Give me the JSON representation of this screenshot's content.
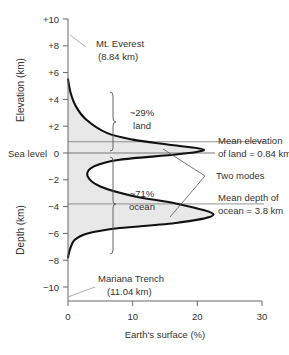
{
  "chart_data": {
    "type": "line",
    "title": "",
    "xlabel": "Earth's surface (%)",
    "ylabel_top": "Elevation (km)",
    "ylabel_bottom": "Depth (km)",
    "xlim": [
      0,
      30
    ],
    "ylim": [
      -11,
      10
    ],
    "x_ticks": [
      {
        "value": 0,
        "label": "0"
      },
      {
        "value": 10,
        "label": "10"
      },
      {
        "value": 20,
        "label": "20"
      },
      {
        "value": 30,
        "label": "30"
      }
    ],
    "y_ticks": [
      {
        "value": 10,
        "label": "+10"
      },
      {
        "value": 8,
        "label": "+8"
      },
      {
        "value": 6,
        "label": "+6"
      },
      {
        "value": 4,
        "label": "+4"
      },
      {
        "value": 2,
        "label": "+2"
      },
      {
        "value": 0,
        "label": "0"
      },
      {
        "value": -2,
        "label": "−2"
      },
      {
        "value": -4,
        "label": "−4"
      },
      {
        "value": -6,
        "label": "−6"
      },
      {
        "value": -8,
        "label": "−8"
      },
      {
        "value": -10,
        "label": "−10"
      }
    ],
    "sea_level_label": "Sea level",
    "series": [
      {
        "name": "Hypsometric distribution",
        "points": [
          {
            "elev": 5.5,
            "pct": 0.0
          },
          {
            "elev": 4.5,
            "pct": 0.4
          },
          {
            "elev": 3.5,
            "pct": 1.2
          },
          {
            "elev": 2.5,
            "pct": 2.8
          },
          {
            "elev": 1.5,
            "pct": 6.0
          },
          {
            "elev": 1.0,
            "pct": 10.0
          },
          {
            "elev": 0.6,
            "pct": 16.0
          },
          {
            "elev": 0.25,
            "pct": 21.0
          },
          {
            "elev": -0.1,
            "pct": 17.0
          },
          {
            "elev": -0.5,
            "pct": 8.0
          },
          {
            "elev": -1.0,
            "pct": 4.0
          },
          {
            "elev": -1.7,
            "pct": 3.0
          },
          {
            "elev": -2.5,
            "pct": 5.0
          },
          {
            "elev": -3.2,
            "pct": 10.0
          },
          {
            "elev": -3.8,
            "pct": 17.0
          },
          {
            "elev": -4.6,
            "pct": 22.5
          },
          {
            "elev": -5.2,
            "pct": 17.0
          },
          {
            "elev": -5.6,
            "pct": 8.0
          },
          {
            "elev": -6.0,
            "pct": 3.0
          },
          {
            "elev": -6.5,
            "pct": 1.0
          },
          {
            "elev": -7.2,
            "pct": 0.3
          },
          {
            "elev": -7.8,
            "pct": 0.0
          }
        ]
      }
    ],
    "reference_lines": [
      {
        "elev": 0,
        "label": "Sea level"
      },
      {
        "elev": 0.84,
        "label": "Mean elevation of land = 0.84 km"
      },
      {
        "elev": -3.8,
        "label": "Mean depth of ocean = 3.8 km"
      }
    ],
    "annotations": [
      {
        "text_lines": [
          "Mt. Everest",
          "(8.84 km)"
        ],
        "elev": 8.84,
        "pct": 0
      },
      {
        "text_lines": [
          "Mariana Trench",
          "(11.04 km)"
        ],
        "elev": -11.04,
        "pct": 0
      },
      {
        "text_lines": [
          "~29%",
          "land"
        ]
      },
      {
        "text_lines": [
          "~71%",
          "ocean"
        ]
      },
      {
        "text_lines": [
          "Mean elevation",
          "of land = 0.84 km"
        ]
      },
      {
        "text_lines": [
          "Two modes"
        ]
      },
      {
        "text_lines": [
          "Mean depth of",
          "ocean = 3.8 km"
        ]
      }
    ],
    "grid": false,
    "legend": "none"
  },
  "labels": {
    "elevation_axis": "Elevation (km)",
    "depth_axis": "Depth (km)",
    "sea_level": "Sea level",
    "x_axis": "Earth's surface (%)",
    "everest_1": "Mt. Everest",
    "everest_2": "(8.84 km)",
    "trench_1": "Mariana Trench",
    "trench_2": "(11.04 km)",
    "land_pct": "~29%",
    "land": "land",
    "ocean_pct": "~71%",
    "ocean": "ocean",
    "mean_elev_1": "Mean elevation",
    "mean_elev_2": "of land = 0.84 km",
    "two_modes": "Two modes",
    "mean_depth_1": "Mean depth of",
    "mean_depth_2": "ocean = 3.8 km"
  },
  "colors": {
    "fill": "#e8e8e8",
    "curve": "#111111",
    "axis": "#666666",
    "ref_line": "#777777"
  }
}
